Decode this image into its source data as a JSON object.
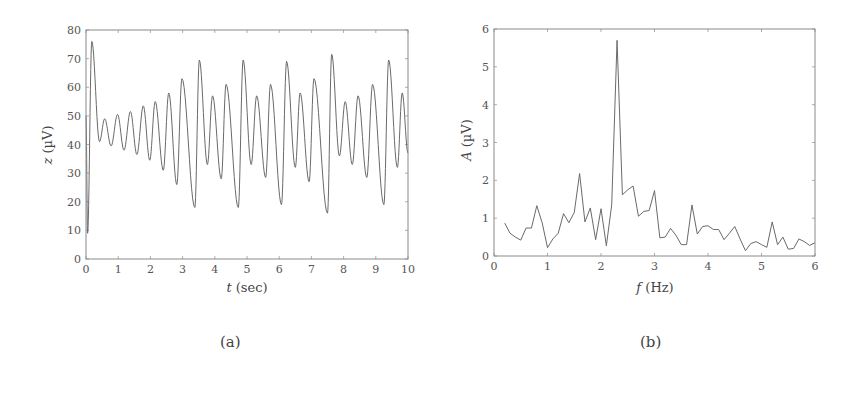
{
  "figure": {
    "captions": {
      "a": "(a)",
      "b": "(b)"
    }
  },
  "chart_data": [
    {
      "id": "a",
      "type": "line",
      "title": "",
      "xlabel_var": "t",
      "xlabel_unit": " (sec)",
      "ylabel_var": "z",
      "ylabel_unit": " (µV)",
      "xlim": [
        0,
        10
      ],
      "ylim": [
        0,
        80
      ],
      "xticks": [
        0,
        1,
        2,
        3,
        4,
        5,
        6,
        7,
        8,
        9,
        10
      ],
      "yticks": [
        0,
        10,
        20,
        30,
        40,
        50,
        60,
        70,
        80
      ],
      "grid": false,
      "legend": null,
      "series": [
        {
          "name": "z(t)",
          "description": "Oscillating signal ~2.3 Hz, extrema (t, z)",
          "x": [
            0.0,
            0.05,
            0.18,
            0.42,
            0.58,
            0.78,
            0.98,
            1.18,
            1.38,
            1.58,
            1.78,
            1.98,
            2.15,
            2.4,
            2.57,
            2.82,
            2.98,
            3.38,
            3.52,
            3.77,
            3.93,
            4.2,
            4.35,
            4.73,
            4.88,
            5.13,
            5.3,
            5.58,
            5.73,
            6.07,
            6.23,
            6.5,
            6.65,
            6.93,
            7.08,
            7.5,
            7.63,
            7.87,
            8.05,
            8.27,
            8.45,
            8.72,
            8.9,
            9.25,
            9.4,
            9.67,
            9.82,
            10.0
          ],
          "y": [
            50,
            9,
            76,
            41,
            49,
            39.5,
            50.5,
            38,
            51.5,
            36.5,
            53.5,
            34.5,
            55,
            31,
            58,
            26,
            63,
            18,
            69.5,
            33,
            57,
            28,
            61,
            18,
            69.5,
            33,
            57,
            28.5,
            61,
            19,
            69,
            32,
            58,
            27,
            63,
            16,
            71.5,
            36,
            55,
            33,
            57,
            28.5,
            61,
            19,
            69.5,
            32,
            58,
            37
          ]
        }
      ]
    },
    {
      "id": "b",
      "type": "line",
      "title": "",
      "xlabel_var": "f",
      "xlabel_unit": " (Hz)",
      "ylabel_var": "A",
      "ylabel_unit": " (µV)",
      "xlim": [
        0,
        6
      ],
      "ylim": [
        0,
        6
      ],
      "xticks": [
        0,
        1,
        2,
        3,
        4,
        5,
        6
      ],
      "yticks": [
        0,
        1,
        2,
        3,
        4,
        5,
        6
      ],
      "grid": false,
      "legend": null,
      "series": [
        {
          "name": "A(f)",
          "description": "Amplitude spectrum with dominant peak at ~2.3 Hz",
          "x": [
            0.2,
            0.3,
            0.4,
            0.5,
            0.6,
            0.7,
            0.8,
            0.9,
            1.0,
            1.1,
            1.2,
            1.3,
            1.4,
            1.5,
            1.6,
            1.7,
            1.8,
            1.9,
            2.0,
            2.1,
            2.2,
            2.3,
            2.4,
            2.5,
            2.6,
            2.7,
            2.8,
            2.9,
            3.0,
            3.1,
            3.2,
            3.3,
            3.4,
            3.5,
            3.6,
            3.7,
            3.8,
            3.9,
            4.0,
            4.1,
            4.2,
            4.3,
            4.4,
            4.5,
            4.6,
            4.7,
            4.8,
            4.9,
            5.0,
            5.1,
            5.2,
            5.3,
            5.4,
            5.5,
            5.6,
            5.7,
            5.8,
            5.9,
            6.0
          ],
          "y": [
            0.87,
            0.6,
            0.5,
            0.42,
            0.74,
            0.74,
            1.33,
            0.88,
            0.22,
            0.45,
            0.6,
            1.12,
            0.88,
            1.15,
            2.18,
            0.9,
            1.27,
            0.43,
            1.25,
            0.27,
            1.35,
            5.7,
            1.62,
            1.75,
            1.85,
            1.05,
            1.18,
            1.2,
            1.73,
            0.48,
            0.5,
            0.73,
            0.55,
            0.3,
            0.3,
            1.35,
            0.58,
            0.78,
            0.8,
            0.7,
            0.7,
            0.43,
            0.6,
            0.78,
            0.45,
            0.14,
            0.33,
            0.38,
            0.3,
            0.23,
            0.9,
            0.3,
            0.5,
            0.18,
            0.2,
            0.45,
            0.38,
            0.28,
            0.35
          ]
        }
      ]
    }
  ]
}
